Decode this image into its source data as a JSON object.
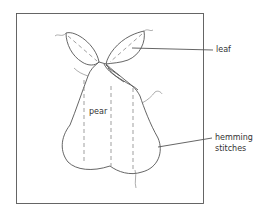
{
  "diagram": {
    "type": "sewing-appliqué-illustration",
    "subject": "pear",
    "labels": {
      "pear": "pear",
      "leaf": "leaf",
      "hemming_line1": "hemming",
      "hemming_line2": "stitches"
    },
    "callouts": [
      {
        "label": "leaf",
        "points_to": "right-leaf"
      },
      {
        "label": "hemming stitches",
        "points_to": "pear-edge"
      }
    ],
    "colors": {
      "line": "#555555",
      "text": "#333333",
      "background": "#ffffff"
    }
  }
}
